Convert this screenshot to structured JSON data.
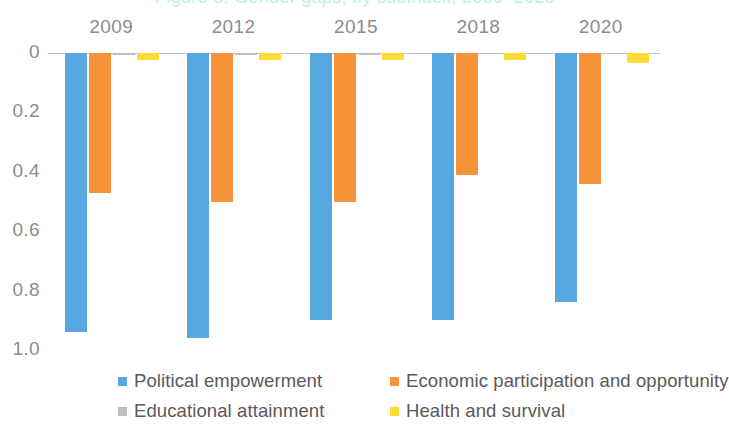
{
  "title": {
    "text": "Figure 5. Gender gaps, by subindex, 2009–2020",
    "color": "#b9f0f4",
    "clipped": true
  },
  "chart_data": {
    "type": "bar",
    "title": "Gender gaps, by subindex",
    "xlabel": "",
    "ylabel": "",
    "categories": [
      "2009",
      "2012",
      "2015",
      "2018",
      "2020"
    ],
    "ylim": [
      0,
      1.0
    ],
    "y_axis_inverted": true,
    "y_ticks": [
      "0",
      "0.2",
      "0.4",
      "0.6",
      "0.8",
      "1.0"
    ],
    "y_tick_values": [
      0,
      0.2,
      0.4,
      0.6,
      0.8,
      1.0
    ],
    "grid": false,
    "legend_position": "bottom",
    "series": [
      {
        "name": "Political empowerment",
        "color": "#57a8e0",
        "values": [
          0.94,
          0.96,
          0.9,
          0.9,
          0.84
        ]
      },
      {
        "name": "Economic participation and opportunity",
        "color": "#f7933a",
        "values": [
          0.47,
          0.5,
          0.5,
          0.41,
          0.44
        ]
      },
      {
        "name": "Educational attainment",
        "color": "#bfbfbf",
        "values": [
          0.007,
          0.006,
          0.006,
          0.005,
          0.005
        ]
      },
      {
        "name": "Health and survival",
        "color": "#fcdc38",
        "values": [
          0.025,
          0.025,
          0.022,
          0.022,
          0.034
        ]
      }
    ]
  },
  "legend": {
    "items": [
      {
        "label": "Political empowerment",
        "color": "#57a8e0"
      },
      {
        "label": "Economic participation and opportunity",
        "color": "#f7933a"
      },
      {
        "label": "Educational attainment",
        "color": "#bfbfbf"
      },
      {
        "label": "Health and survival",
        "color": "#fcdc38"
      }
    ]
  }
}
